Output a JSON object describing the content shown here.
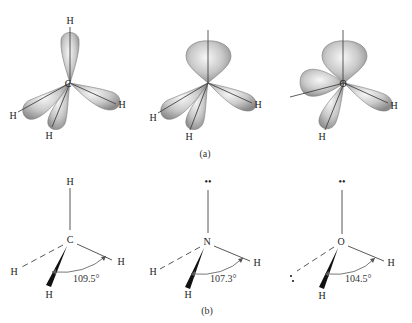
{
  "figure": {
    "panel_a": {
      "caption": "(a)",
      "molecules": [
        {
          "name": "methane-orbitals",
          "center_atom": "C",
          "substituents": [
            "H",
            "H",
            "H",
            "H"
          ],
          "lone_pair_lobes": 0
        },
        {
          "name": "ammonia-orbitals",
          "center_atom": "N",
          "substituents": [
            "H",
            "H",
            "H"
          ],
          "lone_pair_lobes": 1
        },
        {
          "name": "water-orbitals",
          "center_atom": "O",
          "substituents": [
            "H",
            "H"
          ],
          "lone_pair_lobes": 2
        }
      ]
    },
    "panel_b": {
      "caption": "(b)",
      "molecules": [
        {
          "name": "methane",
          "center_atom": "C",
          "top": "H",
          "left": "H",
          "right": "H",
          "bottom": "H",
          "bond_angle": "109.5°"
        },
        {
          "name": "ammonia",
          "center_atom": "N",
          "top": "••",
          "left": "H",
          "right": "H",
          "bottom": "H",
          "bond_angle": "107.3°"
        },
        {
          "name": "water",
          "center_atom": "O",
          "top": "••",
          "left": "••",
          "right": "H",
          "bottom": "H",
          "bond_angle": "104.5°"
        }
      ]
    }
  },
  "colors": {
    "lobe_light": "#f2f2f2",
    "lobe_dark": "#8c8c8c",
    "line": "#444444",
    "background": "#ffffff"
  }
}
